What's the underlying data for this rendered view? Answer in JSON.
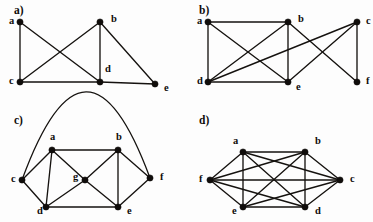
{
  "figure": {
    "background_color": "#fdfdfd",
    "ink_color": "#15120f",
    "width": 373,
    "height": 222
  },
  "panels": [
    {
      "id": "a",
      "label": "a)",
      "label_pos": [
        14,
        11
      ],
      "vertices": [
        {
          "id": "a",
          "x": 20,
          "y": 22,
          "label": "a",
          "label_x": 9,
          "label_y": 22
        },
        {
          "id": "b",
          "x": 100,
          "y": 22,
          "label": "b",
          "label_x": 111,
          "label_y": 20
        },
        {
          "id": "c",
          "x": 20,
          "y": 82,
          "label": "c",
          "label_x": 9,
          "label_y": 82
        },
        {
          "id": "d",
          "x": 100,
          "y": 82,
          "label": "d",
          "label_x": 105,
          "label_y": 70
        },
        {
          "id": "e",
          "x": 155,
          "y": 84,
          "label": "e",
          "label_x": 164,
          "label_y": 89
        }
      ],
      "edges": [
        [
          "a",
          "c"
        ],
        [
          "a",
          "d"
        ],
        [
          "b",
          "c"
        ],
        [
          "b",
          "d"
        ],
        [
          "b",
          "e"
        ],
        [
          "c",
          "d"
        ],
        [
          "d",
          "e"
        ]
      ],
      "edge_count": 7,
      "vertex_count": 5
    },
    {
      "id": "b",
      "label": "b)",
      "label_pos": [
        199,
        11
      ],
      "vertices": [
        {
          "id": "a",
          "x": 208,
          "y": 22,
          "label": "a",
          "label_x": 197,
          "label_y": 22
        },
        {
          "id": "b",
          "x": 288,
          "y": 22,
          "label": "b",
          "label_x": 298,
          "label_y": 20
        },
        {
          "id": "c",
          "x": 357,
          "y": 22,
          "label": "c",
          "label_x": 366,
          "label_y": 22
        },
        {
          "id": "d",
          "x": 208,
          "y": 82,
          "label": "d",
          "label_x": 197,
          "label_y": 82
        },
        {
          "id": "e",
          "x": 288,
          "y": 82,
          "label": "e",
          "label_x": 296,
          "label_y": 88
        },
        {
          "id": "f",
          "x": 357,
          "y": 82,
          "label": "f",
          "label_x": 366,
          "label_y": 82
        }
      ],
      "edges": [
        [
          "a",
          "b"
        ],
        [
          "a",
          "d"
        ],
        [
          "a",
          "e"
        ],
        [
          "b",
          "d"
        ],
        [
          "b",
          "e"
        ],
        [
          "b",
          "f"
        ],
        [
          "d",
          "e"
        ],
        [
          "d",
          "c"
        ],
        [
          "e",
          "c"
        ],
        [
          "c",
          "f"
        ]
      ],
      "edge_count": 10,
      "vertex_count": 6
    },
    {
      "id": "c",
      "label": "c)",
      "label_pos": [
        14,
        121
      ],
      "vertices": [
        {
          "id": "a",
          "x": 52,
          "y": 150,
          "label": "a",
          "label_x": 50,
          "label_y": 138
        },
        {
          "id": "b",
          "x": 118,
          "y": 150,
          "label": "b",
          "label_x": 116,
          "label_y": 138
        },
        {
          "id": "c",
          "x": 22,
          "y": 180,
          "label": "c",
          "label_x": 11,
          "label_y": 180
        },
        {
          "id": "g",
          "x": 85,
          "y": 180,
          "label": "g",
          "label_x": 73,
          "label_y": 178
        },
        {
          "id": "f",
          "x": 150,
          "y": 178,
          "label": "f",
          "label_x": 160,
          "label_y": 178
        },
        {
          "id": "d",
          "x": 46,
          "y": 207,
          "label": "d",
          "label_x": 37,
          "label_y": 212
        },
        {
          "id": "e",
          "x": 118,
          "y": 207,
          "label": "e",
          "label_x": 127,
          "label_y": 212
        }
      ],
      "edges": [
        [
          "a",
          "b"
        ],
        [
          "a",
          "c"
        ],
        [
          "a",
          "d"
        ],
        [
          "a",
          "g"
        ],
        [
          "b",
          "f"
        ],
        [
          "b",
          "e"
        ],
        [
          "b",
          "g"
        ],
        [
          "c",
          "d"
        ],
        [
          "d",
          "e"
        ],
        [
          "d",
          "g"
        ],
        [
          "e",
          "f"
        ],
        [
          "e",
          "g"
        ]
      ],
      "arc_edges": [
        {
          "from": "c",
          "to": "f",
          "sweep": "over-top",
          "peak_y": 124
        }
      ],
      "edge_count": 13,
      "vertex_count": 7
    },
    {
      "id": "d",
      "label": "d)",
      "label_pos": [
        199,
        121
      ],
      "vertices": [
        {
          "id": "a",
          "x": 243,
          "y": 152,
          "label": "a",
          "label_x": 233,
          "label_y": 142
        },
        {
          "id": "b",
          "x": 305,
          "y": 152,
          "label": "b",
          "label_x": 315,
          "label_y": 142
        },
        {
          "id": "c",
          "x": 340,
          "y": 180,
          "label": "c",
          "label_x": 350,
          "label_y": 180
        },
        {
          "id": "d",
          "x": 305,
          "y": 207,
          "label": "d",
          "label_x": 315,
          "label_y": 212
        },
        {
          "id": "e",
          "x": 243,
          "y": 207,
          "label": "e",
          "label_x": 232,
          "label_y": 212
        },
        {
          "id": "f",
          "x": 210,
          "y": 180,
          "label": "f",
          "label_x": 199,
          "label_y": 180
        }
      ],
      "edges": [
        [
          "a",
          "b"
        ],
        [
          "a",
          "c"
        ],
        [
          "a",
          "d"
        ],
        [
          "a",
          "e"
        ],
        [
          "a",
          "f"
        ],
        [
          "b",
          "c"
        ],
        [
          "b",
          "d"
        ],
        [
          "b",
          "e"
        ],
        [
          "b",
          "f"
        ],
        [
          "c",
          "d"
        ],
        [
          "c",
          "e"
        ],
        [
          "c",
          "f"
        ],
        [
          "d",
          "e"
        ],
        [
          "d",
          "f"
        ],
        [
          "e",
          "f"
        ]
      ],
      "edge_count": 15,
      "vertex_count": 6,
      "note": "complete graph K6"
    }
  ]
}
